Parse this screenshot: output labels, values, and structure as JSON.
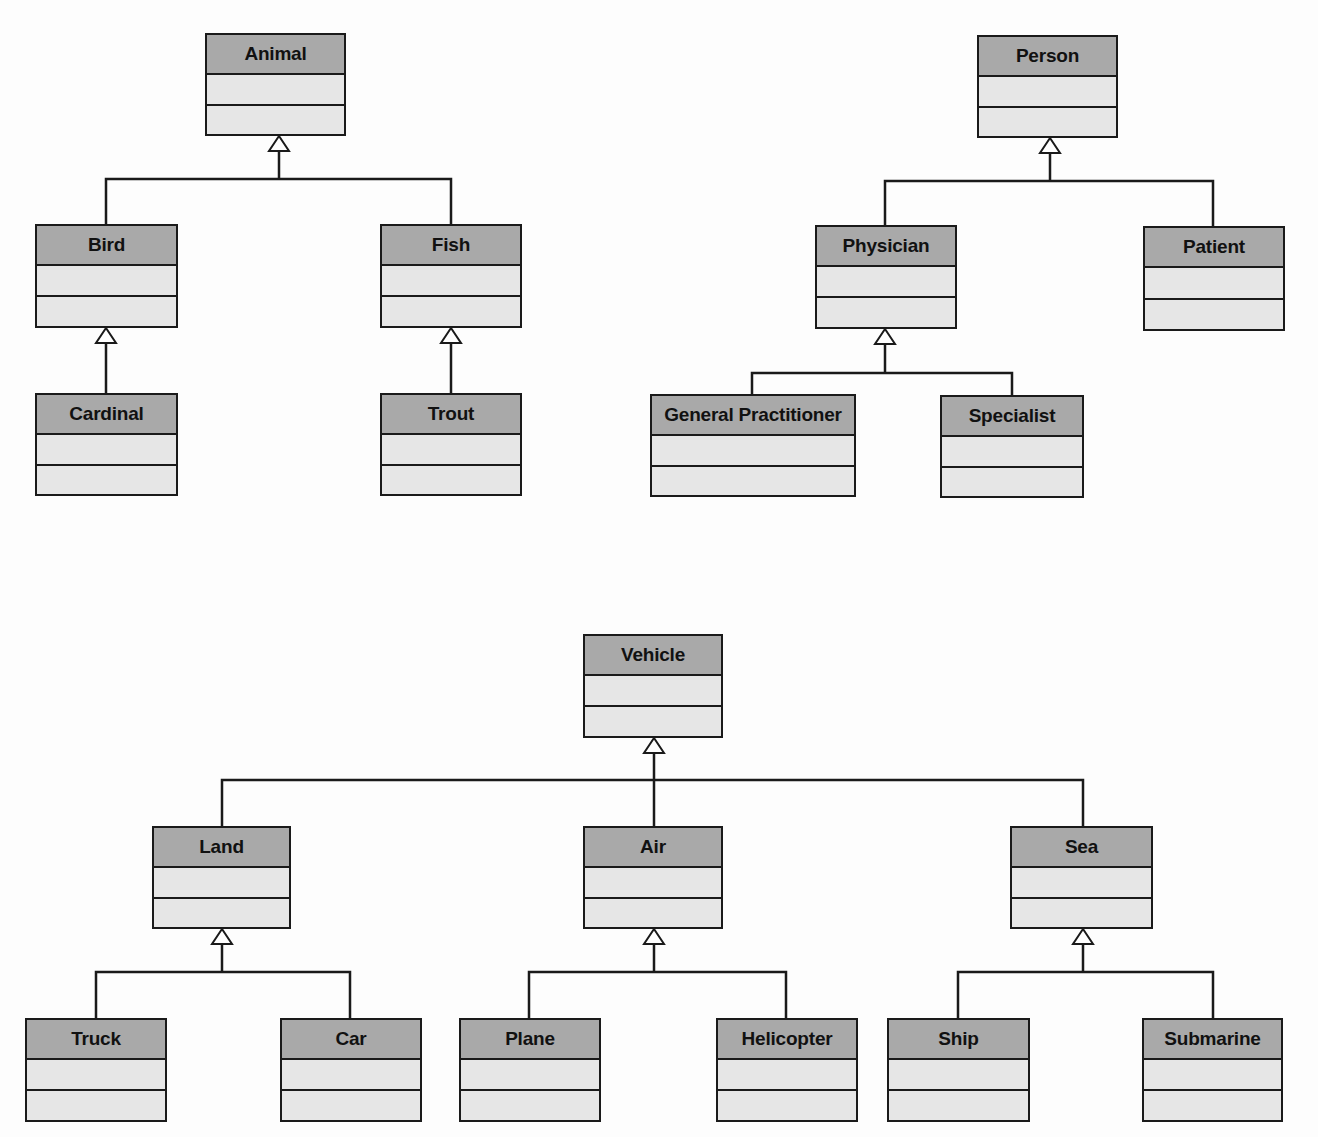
{
  "diagram": {
    "type": "UML class diagram - generalization hierarchies",
    "hierarchies": [
      {
        "root": "Animal",
        "children": [
          {
            "name": "Bird",
            "children": [
              {
                "name": "Cardinal"
              }
            ]
          },
          {
            "name": "Fish",
            "children": [
              {
                "name": "Trout"
              }
            ]
          }
        ]
      },
      {
        "root": "Person",
        "children": [
          {
            "name": "Physician",
            "children": [
              {
                "name": "General Practitioner"
              },
              {
                "name": "Specialist"
              }
            ]
          },
          {
            "name": "Patient"
          }
        ]
      },
      {
        "root": "Vehicle",
        "children": [
          {
            "name": "Land",
            "children": [
              {
                "name": "Truck"
              },
              {
                "name": "Car"
              }
            ]
          },
          {
            "name": "Air",
            "children": [
              {
                "name": "Plane"
              },
              {
                "name": "Helicopter"
              }
            ]
          },
          {
            "name": "Sea",
            "children": [
              {
                "name": "Ship"
              },
              {
                "name": "Submarine"
              }
            ]
          }
        ]
      }
    ],
    "colors": {
      "header_fill": "#a9a9a9",
      "compartment_fill": "#e6e6e6",
      "line": "#1a1a1a",
      "background": "#fdfdfd"
    }
  },
  "classes": {
    "animal": "Animal",
    "bird": "Bird",
    "fish": "Fish",
    "cardinal": "Cardinal",
    "trout": "Trout",
    "person": "Person",
    "physician": "Physician",
    "patient": "Patient",
    "general_practitioner": "General Practitioner",
    "specialist": "Specialist",
    "vehicle": "Vehicle",
    "land": "Land",
    "air": "Air",
    "sea": "Sea",
    "truck": "Truck",
    "car": "Car",
    "plane": "Plane",
    "helicopter": "Helicopter",
    "ship": "Ship",
    "submarine": "Submarine"
  }
}
